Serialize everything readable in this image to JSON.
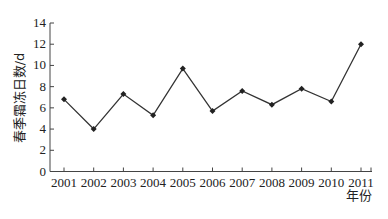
{
  "chart_data": {
    "type": "line",
    "title": "",
    "xlabel": "年份",
    "ylabel": "春季霜冻日数/d",
    "categories": [
      "2001",
      "2002",
      "2003",
      "2004",
      "2005",
      "2006",
      "2007",
      "2008",
      "2009",
      "2010",
      "2011"
    ],
    "series": [
      {
        "name": "春季霜冻日数",
        "values": [
          6.8,
          4.0,
          7.3,
          5.3,
          9.7,
          5.7,
          7.6,
          6.3,
          7.8,
          6.6,
          12.0
        ]
      }
    ],
    "ylim": [
      0,
      14
    ],
    "yticks": [
      0,
      2,
      4,
      6,
      8,
      10,
      12,
      14
    ],
    "grid": false,
    "legend": "none",
    "line_color": "#333333",
    "marker": "diamond"
  }
}
